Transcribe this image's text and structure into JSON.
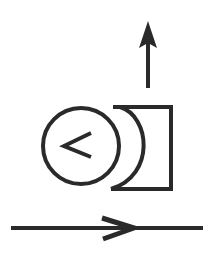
{
  "diagram": {
    "title": "Schematic symbol: rotary element with vertical output and horizontal flow",
    "stroke_color": "#2a2a2a",
    "background_color": "#ffffff",
    "elements": {
      "up_arrow": {
        "semantic": "arrow-up-icon",
        "direction": "up"
      },
      "circle": {
        "semantic": "circle-icon",
        "inner_symbol": "<"
      },
      "bracket": {
        "semantic": "concave-bracket-icon"
      },
      "flow_line": {
        "semantic": "arrow-right-icon",
        "direction": "right"
      }
    }
  }
}
